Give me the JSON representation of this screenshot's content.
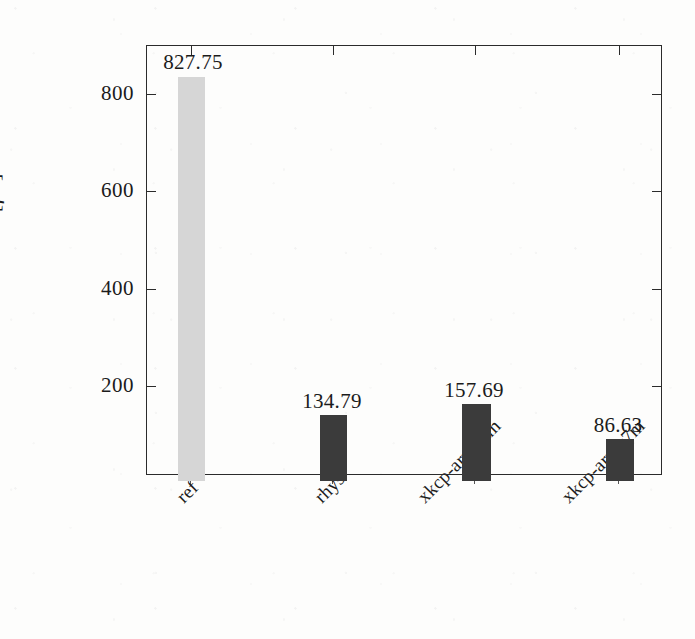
{
  "chart_data": {
    "type": "bar",
    "title": "",
    "xlabel": "",
    "ylabel": "time [μs]",
    "categories": [
      "ref",
      "rhys",
      "xkcp-armv6m",
      "xkcp-armv7m"
    ],
    "values": [
      827.75,
      134.79,
      157.69,
      86.63
    ],
    "value_labels": [
      "827.75",
      "134.79",
      "157.69",
      "86.63"
    ],
    "bar_colors": [
      "#d6d6d6",
      "#3b3b3b",
      "#3b3b3b",
      "#3b3b3b"
    ],
    "ylim": [
      0,
      882
    ],
    "yticks": [
      200,
      400,
      600,
      800
    ],
    "ytick_labels": [
      "200",
      "400",
      "600",
      "800"
    ],
    "grid": false,
    "legend": null,
    "axis_color": "#2b2b2b",
    "background": "#fdfdfc"
  },
  "figure": {
    "y_axis_label": "time [",
    "y_axis_unit_mu": "μ",
    "y_axis_unit_tail": "s]"
  }
}
